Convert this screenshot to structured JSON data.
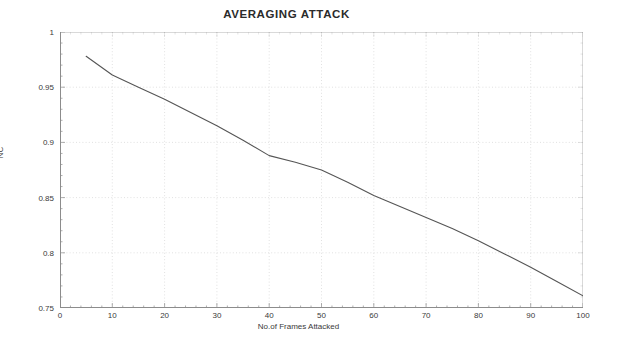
{
  "figure": {
    "title": "AVERAGING ATTACK",
    "background_color": "#ffffff",
    "line_color": "#555555",
    "grid_color": "#d9d9d9",
    "axis_color": "#8c8c8c",
    "text_color": "#3a3a3a"
  },
  "axes": {
    "y_axis_label": "NC",
    "x_axis_label": "No.of Frames Attacked"
  },
  "chart_data": {
    "type": "line",
    "title": "AVERAGING ATTACK",
    "subtitle": "",
    "xlabel": "No.of Frames Attacked",
    "ylabel": "NC",
    "xlim": [
      0,
      100
    ],
    "ylim": [
      0.75,
      1
    ],
    "xticks": [
      0,
      10,
      20,
      30,
      40,
      50,
      60,
      70,
      80,
      90,
      100
    ],
    "xtick_labels": [
      "0",
      "10",
      "20",
      "30",
      "40",
      "50",
      "60",
      "70",
      "80",
      "90",
      "100"
    ],
    "yticks": [
      0.75,
      0.8,
      0.85,
      0.9,
      0.95,
      1
    ],
    "ytick_labels": [
      "0.75",
      "0.8",
      "0.85",
      "0.9",
      "0.95",
      "1"
    ],
    "grid": true,
    "grid_style": "dotted",
    "legend": false,
    "legend_position": "none",
    "markers": false,
    "series": [
      {
        "name": "NC",
        "color": "#555555",
        "x": [
          5,
          10,
          15,
          20,
          25,
          30,
          35,
          40,
          45,
          50,
          55,
          60,
          65,
          70,
          75,
          80,
          85,
          90,
          95,
          100
        ],
        "y": [
          0.978,
          0.961,
          0.95,
          0.939,
          0.927,
          0.915,
          0.902,
          0.888,
          0.882,
          0.875,
          0.864,
          0.852,
          0.842,
          0.832,
          0.822,
          0.811,
          0.799,
          0.787,
          0.774,
          0.761
        ]
      }
    ]
  }
}
